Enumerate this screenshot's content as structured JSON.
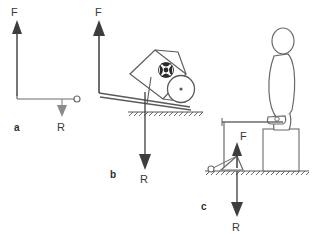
{
  "figure": {
    "stroke_color": "#4a4a4a",
    "arrow_color": "#3d3d3d",
    "fill_white": "#ffffff",
    "load_color": "#2b2b2b",
    "background": "#ffffff"
  },
  "panels": [
    {
      "id": "a",
      "label": "a",
      "label_pos": {
        "x": 14,
        "y": 130
      },
      "force_label": "F",
      "force_label_pos": {
        "x": 11,
        "y": 16
      },
      "reaction_label": "R",
      "reaction_label_pos": {
        "x": 58,
        "y": 128
      },
      "effort_arrow": {
        "x": 17,
        "y1": 96,
        "y2": 22,
        "direction": "up"
      },
      "bar": {
        "x1": 17,
        "y1": 99,
        "x2": 78,
        "y2": 99
      },
      "pivot_circle": {
        "cx": 77,
        "cy": 99,
        "r": 3
      },
      "load_arrow": {
        "x": 62,
        "y1": 99,
        "y2": 116,
        "direction": "down"
      }
    },
    {
      "id": "b",
      "label": "b",
      "label_pos": {
        "x": 112,
        "y": 176
      },
      "force_label": "F",
      "force_label_pos": {
        "x": 95,
        "y": 16
      },
      "reaction_label": "R",
      "reaction_label_pos": {
        "x": 140,
        "y": 180
      },
      "effort_arrow": {
        "x": 99,
        "y1": 92,
        "y2": 22,
        "direction": "up"
      },
      "load_arrow": {
        "x": 145,
        "y1": 92,
        "y2": 168,
        "direction": "down"
      },
      "ground_line": {
        "x1": 128,
        "x2": 203,
        "y": 112
      },
      "object": "wheelbarrow",
      "wheel": {
        "cx": 181,
        "cy": 89,
        "r": 13
      },
      "tray": "tilted rectangular bed with round load"
    },
    {
      "id": "c",
      "label": "c",
      "label_pos": {
        "x": 203,
        "y": 208
      },
      "force_label": "F",
      "force_label_pos": {
        "x": 240,
        "y": 138
      },
      "reaction_label": "R",
      "reaction_label_pos": {
        "x": 232,
        "y": 228
      },
      "effort_arrow": {
        "x": 237,
        "y1": 166,
        "y2": 142,
        "direction": "up"
      },
      "load_arrow": {
        "x": 237,
        "y1": 171,
        "y2": 216,
        "direction": "down"
      },
      "ground_line": {
        "x1": 205,
        "x2": 309,
        "y": 171
      },
      "lever_bar": {
        "x1": 223,
        "x2": 283,
        "y": 122
      },
      "fulcrum_triangle": {
        "apex_x": 237,
        "apex_y": 157,
        "base_left": 220,
        "base_right": 241,
        "base_y": 170
      },
      "pivot_circle": {
        "cx": 213,
        "cy": 168,
        "r": 3
      },
      "box": {
        "x": 263,
        "y": 129,
        "w": 36,
        "h": 42
      },
      "object": "person standing with foot on lever"
    }
  ]
}
